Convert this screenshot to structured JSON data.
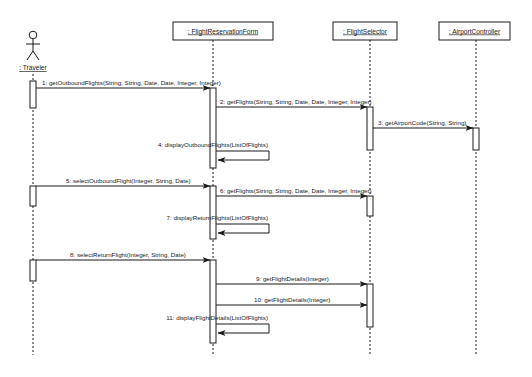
{
  "diagram": {
    "type": "uml-sequence",
    "participants": [
      {
        "id": "traveler",
        "label": ": Traveler",
        "kind": "actor"
      },
      {
        "id": "form",
        "label": ": FlightReservationForm",
        "kind": "object"
      },
      {
        "id": "selector",
        "label": ": FlightSelector",
        "kind": "object"
      },
      {
        "id": "airport",
        "label": ": AirportController",
        "kind": "object"
      }
    ],
    "messages": [
      {
        "n": "1",
        "label": "1:  getOutboundFlights(String, String, Date, Date, Integer, Integer)",
        "from": "traveler",
        "to": "form"
      },
      {
        "n": "2",
        "label": "2:  getFlights(String, String, Date, Date, Integer, Integer)",
        "from": "form",
        "to": "selector"
      },
      {
        "n": "3",
        "label": "3:  getAirportCode(String, String)",
        "from": "selector",
        "to": "airport"
      },
      {
        "n": "4",
        "label": "4:  displayOutboundFlights(ListOfFlights)",
        "from": "form",
        "to": "form"
      },
      {
        "n": "5",
        "label": "5:  selectOutboundFlight(Integer, String, Date)",
        "from": "traveler",
        "to": "form"
      },
      {
        "n": "6",
        "label": "6:  getFlights(String, String, Date, Date, Integer, Integer)",
        "from": "form",
        "to": "selector"
      },
      {
        "n": "7",
        "label": "7: displayReturnFlights(ListOfFlights)",
        "from": "form",
        "to": "form"
      },
      {
        "n": "8",
        "label": "8:  selectReturnFlight(Integer, String, Date)",
        "from": "traveler",
        "to": "form"
      },
      {
        "n": "9",
        "label": "9:  getFlightDetails(Integer)",
        "from": "form",
        "to": "selector"
      },
      {
        "n": "10",
        "label": "10:  getFlightDetails(Integer)",
        "from": "form",
        "to": "selector"
      },
      {
        "n": "11",
        "label": "11:  displayFlightDetails(ListOfFlights)",
        "from": "form",
        "to": "form"
      }
    ]
  },
  "colors": {
    "line": "#1a1a1a",
    "background": "#ffffff"
  }
}
